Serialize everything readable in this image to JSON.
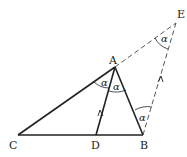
{
  "diagram": {
    "type": "geometry",
    "points": {
      "A": {
        "label": "A",
        "x": 115,
        "y": 67
      },
      "B": {
        "label": "B",
        "x": 143,
        "y": 135
      },
      "C": {
        "label": "C",
        "x": 18,
        "y": 135
      },
      "D": {
        "label": "D",
        "x": 96,
        "y": 135
      },
      "E": {
        "label": "E",
        "x": 176,
        "y": 23
      }
    },
    "angle_symbol": "α",
    "solid_segments": [
      "CA",
      "AB",
      "CB",
      "AD"
    ],
    "dashed_segments": [
      "AE",
      "BE"
    ],
    "parallel_marks": [
      "AD",
      "BE"
    ],
    "colors": {
      "line": "#222222",
      "background": "#ffffff"
    }
  }
}
